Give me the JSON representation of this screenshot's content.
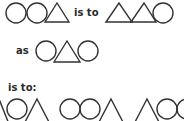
{
  "puzzle": {
    "type": "analogy",
    "row1": {
      "left_figure": [
        "circle",
        "circle",
        "triangle"
      ],
      "connector": "is to",
      "right_figure": [
        "triangle",
        "triangle",
        "circle"
      ]
    },
    "row2": {
      "connector": "as",
      "figure": [
        "circle",
        "triangle",
        "circle"
      ]
    },
    "row3": {
      "connector": "is to:",
      "options_visible": [
        [
          "triangle",
          "circle",
          "triangle"
        ],
        [
          "circle",
          "circle",
          "triangle"
        ],
        [
          "triangle",
          "triangle",
          "circle",
          "circle"
        ]
      ]
    }
  },
  "colors": {
    "stroke": "#333333",
    "text": "#2a2a2a",
    "background": "#ffffff"
  }
}
